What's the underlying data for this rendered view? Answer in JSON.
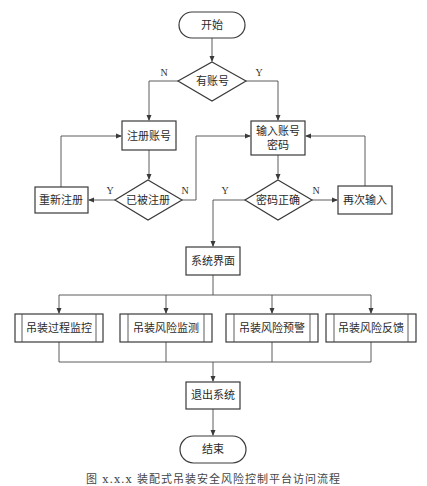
{
  "diagram": {
    "type": "flowchart",
    "nodes": {
      "start": {
        "label": "开始",
        "shape": "terminal"
      },
      "has_account": {
        "label": "有账号",
        "shape": "decision"
      },
      "register": {
        "label": "注册账号",
        "shape": "process"
      },
      "input_credentials": {
        "label_line1": "输入账号",
        "label_line2": "密码",
        "shape": "process"
      },
      "already_registered": {
        "label": "已被注册",
        "shape": "decision"
      },
      "re_register": {
        "label": "重新注册",
        "shape": "process"
      },
      "password_correct": {
        "label": "密码正确",
        "shape": "decision"
      },
      "re_input": {
        "label": "再次输入",
        "shape": "process"
      },
      "system_ui": {
        "label": "系统界面",
        "shape": "process"
      },
      "module1": {
        "label": "吊装过程监控",
        "shape": "predefined-process"
      },
      "module2": {
        "label": "吊装风险监测",
        "shape": "predefined-process"
      },
      "module3": {
        "label": "吊装风险预警",
        "shape": "predefined-process"
      },
      "module4": {
        "label": "吊装风险反馈",
        "shape": "predefined-process"
      },
      "exit": {
        "label": "退出系统",
        "shape": "process"
      },
      "end": {
        "label": "结束",
        "shape": "terminal"
      }
    },
    "edge_labels": {
      "has_account_no": "N",
      "has_account_yes": "Y",
      "registered_yes": "Y",
      "registered_no": "N",
      "correct_yes": "Y",
      "correct_no": "N"
    },
    "edges": [
      {
        "from": "start",
        "to": "has_account"
      },
      {
        "from": "has_account",
        "to": "register",
        "label": "N"
      },
      {
        "from": "has_account",
        "to": "input_credentials",
        "label": "Y"
      },
      {
        "from": "register",
        "to": "already_registered"
      },
      {
        "from": "already_registered",
        "to": "re_register",
        "label": "Y"
      },
      {
        "from": "already_registered",
        "to": "input_credentials",
        "label": "N"
      },
      {
        "from": "re_register",
        "to": "register"
      },
      {
        "from": "input_credentials",
        "to": "password_correct"
      },
      {
        "from": "password_correct",
        "to": "system_ui",
        "label": "Y"
      },
      {
        "from": "password_correct",
        "to": "re_input",
        "label": "N"
      },
      {
        "from": "re_input",
        "to": "input_credentials"
      },
      {
        "from": "system_ui",
        "to": "module1"
      },
      {
        "from": "system_ui",
        "to": "module2"
      },
      {
        "from": "system_ui",
        "to": "module3"
      },
      {
        "from": "system_ui",
        "to": "module4"
      },
      {
        "from": "module1",
        "to": "exit"
      },
      {
        "from": "module2",
        "to": "exit"
      },
      {
        "from": "module3",
        "to": "exit"
      },
      {
        "from": "module4",
        "to": "exit"
      },
      {
        "from": "exit",
        "to": "end"
      }
    ]
  },
  "caption": "图 x.x.x 装配式吊装安全风险控制平台访问流程"
}
